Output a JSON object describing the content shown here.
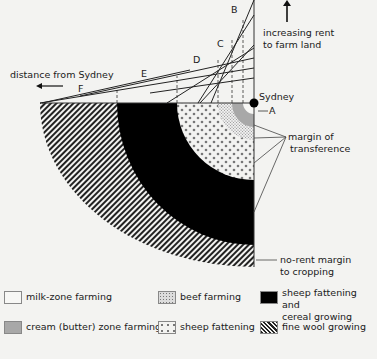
{
  "diagram": {
    "center_label": "Sydney",
    "axis_x_label": "distance from Sydney",
    "axis_y_label_line1": "increasing rent",
    "axis_y_label_line2": "to farm land",
    "curve_labels": [
      "A",
      "B",
      "C",
      "D",
      "E",
      "F"
    ],
    "annotation_margin_line1": "margin of",
    "annotation_margin_line2": "transference",
    "annotation_norent_line1": "no-rent margin",
    "annotation_norent_line2": "to cropping"
  },
  "legend": {
    "items": [
      {
        "label": "milk-zone farming",
        "pattern": "plain",
        "color": "#f7f7f5"
      },
      {
        "label": "beef farming",
        "pattern": "fine-dots",
        "color": "#d9d9d9"
      },
      {
        "label_line1": "sheep fattening and",
        "label_line2": "cereal growing",
        "pattern": "solid",
        "color": "#000000"
      },
      {
        "label": "cream (butter) zone farming",
        "pattern": "solid",
        "color": "#a8a8a8"
      },
      {
        "label": "sheep fattening",
        "pattern": "coarse-dots",
        "color": "#888888"
      },
      {
        "label": "fine wool growing",
        "pattern": "hatch",
        "color": "#222222"
      }
    ]
  }
}
